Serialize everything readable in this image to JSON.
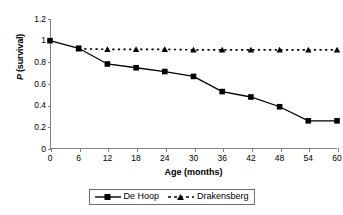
{
  "chart_data": {
    "type": "line",
    "title": "",
    "xlabel": "Age (months)",
    "ylabel": "P (survival)",
    "ylabel_italic_part": "P",
    "ylabel_rest": " (survival)",
    "x": [
      0,
      6,
      12,
      18,
      24,
      30,
      36,
      42,
      48,
      54,
      60
    ],
    "xtick_labels": [
      "0",
      "6",
      "12",
      "18",
      "24",
      "30",
      "36",
      "42",
      "48",
      "54",
      "60"
    ],
    "ytick_labels": [
      "0",
      "0.2",
      "0.4",
      "0.6",
      "0.8",
      "1",
      "1.2"
    ],
    "ytick_values": [
      0,
      0.2,
      0.4,
      0.6,
      0.8,
      1,
      1.2
    ],
    "xlim": [
      0,
      60
    ],
    "ylim": [
      0,
      1.2
    ],
    "grid": false,
    "legend_position": "bottom",
    "series": [
      {
        "name": "De Hoop",
        "marker": "square",
        "linestyle": "solid",
        "color": "#000000",
        "values": [
          1.0,
          0.93,
          0.785,
          0.75,
          0.715,
          0.67,
          0.53,
          0.48,
          0.39,
          0.26,
          0.26
        ]
      },
      {
        "name": "Drakensberg",
        "marker": "triangle",
        "linestyle": "dashed",
        "color": "#000000",
        "values": [
          null,
          0.925,
          0.92,
          0.92,
          0.92,
          0.915,
          0.915,
          0.915,
          0.915,
          0.915,
          0.915
        ]
      }
    ]
  },
  "legend": {
    "entries": [
      {
        "label": "De Hoop",
        "marker": "square-marker-icon",
        "line": "solid-line-icon"
      },
      {
        "label": "Drakensberg",
        "marker": "triangle-marker-icon",
        "line": "dashed-line-icon"
      }
    ]
  },
  "axes": {
    "x_title": "Age (months)",
    "y_title_italic": "P",
    "y_title_rest": " (survival)"
  }
}
